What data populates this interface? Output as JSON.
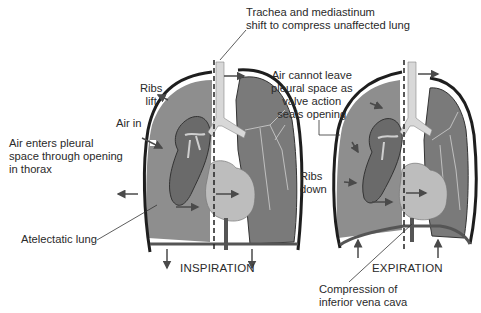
{
  "diagram": {
    "panels": [
      {
        "id": "inspiration",
        "caption": "INSPIRATION"
      },
      {
        "id": "expiration",
        "caption": "EXPIRATION"
      }
    ],
    "labels": {
      "trachea_line1": "Trachea and mediastinum",
      "trachea_line2": "shift to compress unaffected lung",
      "ribs_lift_1": "Ribs",
      "ribs_lift_2": "lift",
      "air_in": "Air in",
      "air_enters_1": "Air enters pleural",
      "air_enters_2": "space through opening",
      "air_enters_3": "in thorax",
      "atelectatic": "Atelectatic lung",
      "air_cannot_1": "Air cannot leave",
      "air_cannot_2": "pleural space as",
      "air_cannot_3": "valve action",
      "air_cannot_4": "seals opening",
      "ribs_down_1": "Ribs",
      "ribs_down_2": "down",
      "compression_1": "Compression of",
      "compression_2": "inferior vena cava"
    },
    "colors": {
      "pleural_space": "#8e8e8e",
      "collapsed_lung": "#6a6a6a",
      "normal_lung": "#7a7a7a",
      "trachea": "#d8d8d8",
      "heart": "#bdbdbd",
      "chest_wall": "#1e1e1e",
      "arrow": "#4a4a4a"
    }
  }
}
